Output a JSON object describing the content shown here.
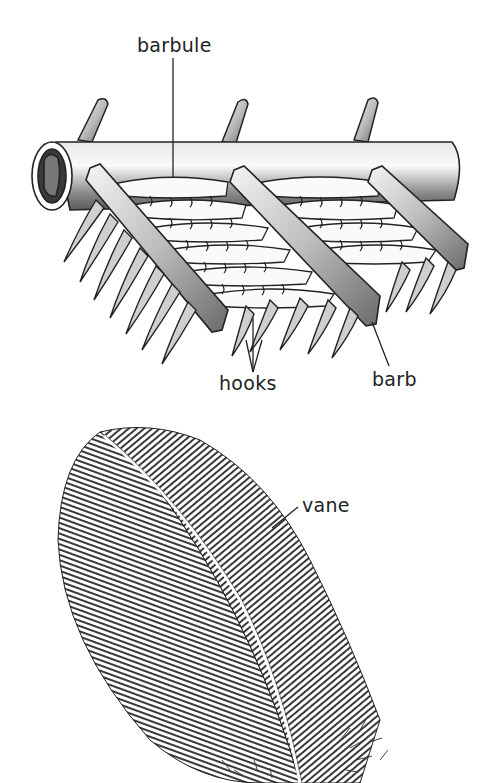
{
  "diagram": {
    "labels": {
      "barbule": "barbule",
      "hooks": "hooks",
      "barb": "barb",
      "vane": "vane"
    },
    "colors": {
      "ink": "#222222",
      "paper": "#ffffff",
      "shade": "#9a9a9a",
      "highlight": "#f2f2f2"
    },
    "parts": [
      {
        "id": "shaft",
        "description": "cylindrical barb shaft seen in cross-section at left"
      },
      {
        "id": "barbs",
        "count": 3,
        "description": "diagonal barb ridges crossing the shaft"
      },
      {
        "id": "barbules",
        "description": "flat hooked blades between barbs"
      },
      {
        "id": "hooks",
        "description": "curved hooklets hanging below barbs"
      },
      {
        "id": "feather",
        "description": "engraved contour feather with central rachis and vane"
      }
    ]
  }
}
